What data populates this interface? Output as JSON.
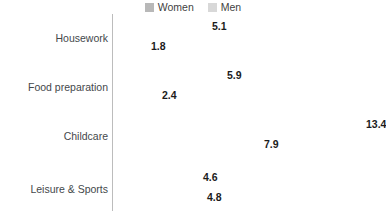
{
  "legend": {
    "position": "top-center",
    "entries": [
      {
        "label": "Women",
        "color": "#b8b8b8",
        "swatch_name": "legend-swatch-women"
      },
      {
        "label": "Men",
        "color": "#d8d8d8",
        "swatch_name": "legend-swatch-men"
      }
    ]
  },
  "axis": {
    "cut_off_title": "s)",
    "line_color": "#bcbcbc",
    "value_label_color": "#1b1b1b",
    "category_label_color": "#44484b"
  },
  "chart_data": {
    "type": "bar",
    "orientation": "horizontal",
    "title": "",
    "subtitle": "",
    "xlabel": "",
    "ylabel": "",
    "grid": false,
    "legend_position": "top-center",
    "xlim": [
      0,
      14.5
    ],
    "categories": [
      "Housework",
      "Food preparation",
      "Childcare",
      "Leisure & Sports"
    ],
    "series": [
      {
        "name": "Women",
        "color": "#b8b8b8",
        "values": [
          5.1,
          5.9,
          13.4,
          4.6
        ],
        "labels": [
          "5.1",
          "5.9",
          "13.4",
          "4.6"
        ]
      },
      {
        "name": "Men",
        "color": "#d8d8d8",
        "values": [
          1.8,
          2.4,
          7.9,
          4.8
        ],
        "labels": [
          "1.8",
          "2.4",
          "7.9",
          "4.8"
        ]
      }
    ]
  }
}
